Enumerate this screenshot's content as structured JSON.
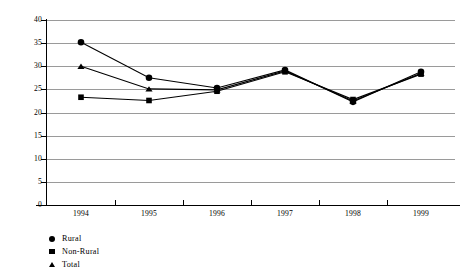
{
  "chart_data": {
    "type": "line",
    "title": "",
    "subtitle": "",
    "xlabel": "",
    "ylabel": "",
    "categories": [
      "1994",
      "1995",
      "1996",
      "1997",
      "1998",
      "1999"
    ],
    "x": [
      1994,
      1995,
      1996,
      1997,
      1998,
      1999
    ],
    "ylim": [
      0,
      40
    ],
    "ytick_step": 5,
    "yticks": [
      "0",
      "5",
      "10",
      "15",
      "20",
      "25",
      "30",
      "35",
      "40"
    ],
    "grid": "horizontal",
    "legend_position": "below-left",
    "series": [
      {
        "name": "Rural",
        "marker": "circle",
        "color": "#000000",
        "values": [
          35.2,
          27.5,
          25.3,
          29.2,
          22.3,
          28.8
        ]
      },
      {
        "name": "Non-Rural",
        "marker": "square",
        "color": "#000000",
        "values": [
          23.3,
          22.6,
          24.6,
          28.8,
          22.8,
          28.3
        ]
      },
      {
        "name": "Total",
        "marker": "triangle",
        "color": "#000000",
        "values": [
          30.0,
          25.1,
          24.9,
          29.0,
          22.5,
          28.5
        ]
      }
    ]
  },
  "axes": {
    "y_tick_labels": [
      "40",
      "35",
      "30",
      "25",
      "20",
      "15",
      "10",
      "5",
      "0"
    ],
    "x_tick_labels": [
      "1994",
      "1995",
      "1996",
      "1997",
      "1998",
      "1999"
    ]
  },
  "legend": {
    "entries": [
      {
        "label": "Rural",
        "marker": "circle-marker-icon"
      },
      {
        "label": "Non-Rural",
        "marker": "square-marker-icon"
      },
      {
        "label": "Total",
        "marker": "triangle-marker-icon"
      }
    ]
  },
  "colors": {
    "series": "#000000",
    "gridline": "#9a9a9a",
    "axis": "#000000",
    "background": "#ffffff"
  }
}
